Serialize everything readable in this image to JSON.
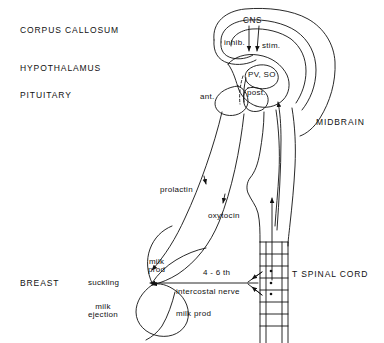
{
  "figure": {
    "type": "anatomical-line-diagram",
    "stroke_color": "#111111",
    "background_color": "#ffffff"
  },
  "region_labels": {
    "corpus_callosum": "CORPUS CALLOSUM",
    "hypothalamus": "HYPOTHALAMUS",
    "pituitary": "PITUITARY",
    "midbrain": "MIDBRAIN",
    "breast": "BREAST",
    "spinal_cord": "T SPINAL CORD"
  },
  "structure_labels": {
    "cns": "CNS",
    "inhib": "inhib.",
    "stim": "stim.",
    "pv_so": "PV, SO",
    "ant": "ant.",
    "post": "post."
  },
  "pathway_labels": {
    "prolactin": "prolactin",
    "oxytocin": "oxytocin",
    "suckling": "suckling",
    "milk_prod_upper_line1": "milk",
    "milk_prod_upper_line2": "prod",
    "milk_ejection_line1": "milk",
    "milk_ejection_line2": "ejection",
    "milk_prod_lower": "milk prod",
    "nerve_line1": "4 - 6 th",
    "nerve_line2": "intercostal nerve"
  },
  "icons": {
    "arrow_down_inhib": "arrow-down-icon",
    "arrow_down_stim": "arrow-down-icon",
    "arrow_up_afferent": "arrow-up-icon",
    "arrow_left_suckling": "arrow-left-icon",
    "arrow_down_prolactin": "arrow-down-icon",
    "arrow_down_oxytocin": "arrow-down-icon"
  }
}
